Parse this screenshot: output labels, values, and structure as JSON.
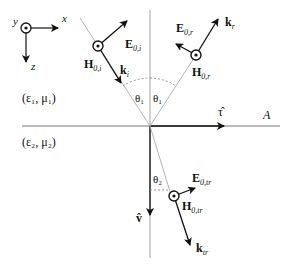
{
  "coordinate_axes": {
    "x_label": "x",
    "y_label": "y",
    "z_label": "z"
  },
  "media": {
    "upper": "(ε₁, μ₁)",
    "lower": "(ε₂, μ₂)"
  },
  "interface": {
    "tangent_label": "τ̂",
    "normal_label": "v̂",
    "plane_label": "A"
  },
  "incident": {
    "E_label_main": "E",
    "E_label_sub": "0,i",
    "H_label_main": "H",
    "H_label_sub": "0,i",
    "k_label_main": "k",
    "k_label_sub": "i",
    "angle_label": "θ₁"
  },
  "reflected": {
    "E_label_main": "E",
    "E_label_sub": "0,r",
    "H_label_main": "H",
    "H_label_sub": "0,r",
    "k_label_main": "k",
    "k_label_sub": "r",
    "angle_label": "θ₁"
  },
  "transmitted": {
    "E_label_main": "E",
    "E_label_sub": "0,tr",
    "H_label_main": "H",
    "H_label_sub": "0,tr",
    "k_label_main": "k",
    "k_label_sub": "tr",
    "angle_label": "θ₂"
  },
  "colors": {
    "ink": "#111111",
    "guide": "#aaaaaa"
  }
}
